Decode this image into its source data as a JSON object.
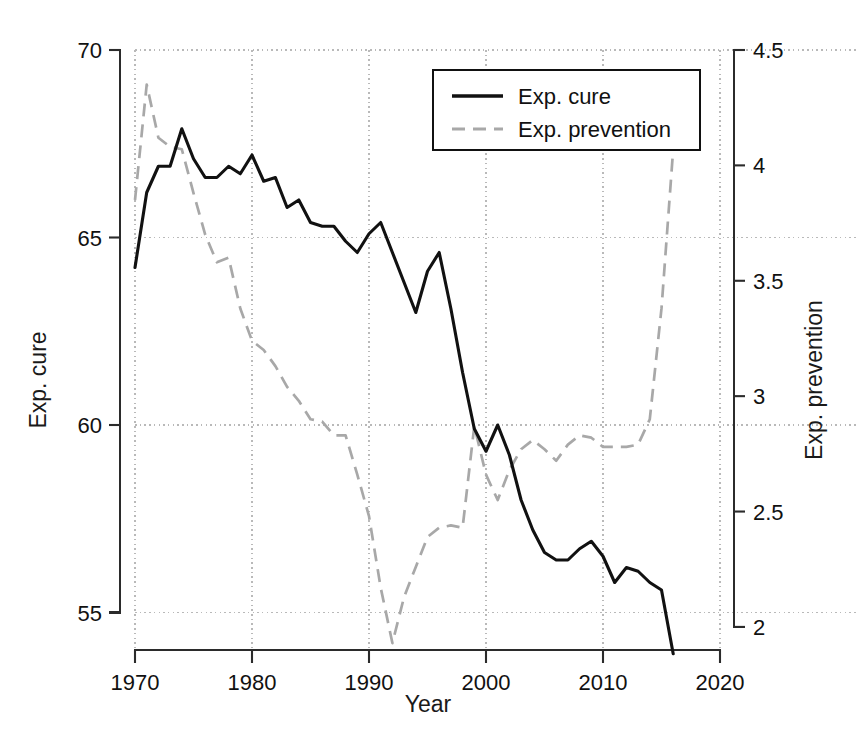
{
  "chart_data": {
    "type": "line",
    "title": "",
    "xlabel": "Year",
    "ylabel": "Exp. cure",
    "y2label": "Exp. prevention",
    "xlim": [
      1970,
      2020
    ],
    "ylim": [
      54.0,
      70.0
    ],
    "y2lim": [
      1.9,
      4.5
    ],
    "xticks": [
      1970,
      1980,
      1990,
      2000,
      2010,
      2020
    ],
    "xtick_labels": [
      "1970",
      "1980",
      "1990",
      "2000",
      "2010",
      "2020"
    ],
    "yticks": [
      55,
      60,
      65,
      70
    ],
    "ytick_labels": [
      "55",
      "60",
      "65",
      "70"
    ],
    "y2ticks": [
      2,
      2.5,
      3,
      3.5,
      4,
      4.5
    ],
    "y2tick_labels": [
      "2",
      "2.5",
      "3",
      "3.5",
      "4",
      "4.5"
    ],
    "grid": true,
    "grid_style": "dotted",
    "legend_position": "top-center-right",
    "x": [
      1970,
      1971,
      1972,
      1973,
      1974,
      1975,
      1976,
      1977,
      1978,
      1979,
      1980,
      1981,
      1982,
      1983,
      1984,
      1985,
      1986,
      1987,
      1988,
      1989,
      1990,
      1991,
      1992,
      1993,
      1994,
      1995,
      1996,
      1997,
      1998,
      1999,
      2000,
      2001,
      2002,
      2003,
      2004,
      2005,
      2006,
      2007,
      2008,
      2009,
      2010,
      2011,
      2012,
      2013,
      2014,
      2015,
      2016
    ],
    "series": [
      {
        "name": "Exp. cure",
        "axis": "left",
        "style": "solid",
        "color": "#111111",
        "values": [
          64.2,
          66.2,
          66.9,
          66.9,
          67.9,
          67.1,
          66.6,
          66.6,
          66.9,
          66.7,
          67.2,
          66.5,
          66.6,
          65.8,
          66.0,
          65.4,
          65.3,
          65.3,
          64.9,
          64.6,
          65.1,
          65.4,
          64.6,
          63.8,
          63.0,
          64.1,
          64.6,
          63.1,
          61.4,
          59.9,
          59.3,
          60.0,
          59.2,
          58.0,
          57.2,
          56.6,
          56.4,
          56.4,
          56.7,
          56.9,
          56.5,
          55.8,
          56.2,
          56.1,
          55.8,
          55.6,
          53.9
        ]
      },
      {
        "name": "Exp. prevention",
        "axis": "right",
        "style": "dashed",
        "color": "#a8a8a8",
        "values": [
          3.85,
          4.35,
          4.12,
          4.08,
          4.07,
          3.88,
          3.7,
          3.58,
          3.6,
          3.38,
          3.24,
          3.2,
          3.13,
          3.04,
          2.98,
          2.9,
          2.89,
          2.83,
          2.83,
          2.66,
          2.48,
          2.17,
          1.93,
          2.13,
          2.26,
          2.39,
          2.43,
          2.44,
          2.43,
          2.87,
          2.66,
          2.55,
          2.68,
          2.77,
          2.81,
          2.77,
          2.72,
          2.79,
          2.83,
          2.82,
          2.78,
          2.78,
          2.78,
          2.79,
          2.9,
          3.38,
          4.07
        ]
      }
    ]
  },
  "axes": {
    "x_title": "Year",
    "y_left_title": "Exp. cure",
    "y_right_title": "Exp. prevention"
  },
  "legend": {
    "entries": [
      {
        "label": "Exp. cure",
        "style": "solid"
      },
      {
        "label": "Exp. prevention",
        "style": "dashed"
      }
    ]
  },
  "colors": {
    "cure": "#111111",
    "prevention": "#a8a8a8",
    "grid": "#b9b9b9",
    "axis": "#2b2b2b",
    "background": "#ffffff"
  }
}
